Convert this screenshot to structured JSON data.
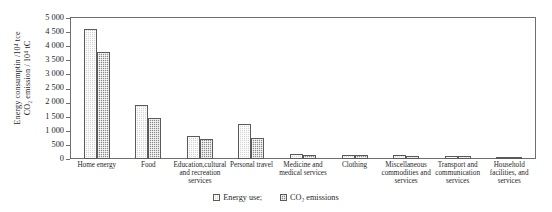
{
  "chart_data": {
    "type": "bar",
    "title": "",
    "xlabel": "",
    "ylabel_line1": "Energy consumptin /10⁴ tce",
    "ylabel_line2": "CO₂ emission / 10⁴ tC",
    "ylim": [
      0,
      5000
    ],
    "ytick_labels": [
      "5 000",
      "4 500",
      "4 000",
      "3 500",
      "3 000",
      "2 500",
      "2 000",
      "1 500",
      "1 000",
      "500",
      "0"
    ],
    "ytick_values": [
      5000,
      4500,
      4000,
      3500,
      3000,
      2500,
      2000,
      1500,
      1000,
      500,
      0
    ],
    "grid": false,
    "legend_position": "bottom-center",
    "categories": [
      "Home energy",
      "Food",
      "Education,cultural and recreation services",
      "Personal travel",
      "Medicine and medical services",
      "Clothing",
      "Miscellaneous commodities and services",
      "Transport and communication services",
      "Household facilities, and services"
    ],
    "series": [
      {
        "name": "Energy use;",
        "color": "#d4d4d4",
        "values": [
          4600,
          1900,
          800,
          1250,
          180,
          150,
          130,
          110,
          80
        ]
      },
      {
        "name": "CO₂ emissions",
        "color": "#8a8a8a",
        "values": [
          3800,
          1450,
          700,
          750,
          150,
          130,
          120,
          90,
          60
        ]
      }
    ]
  },
  "axis": {
    "category_labels": [
      [
        "Home energy"
      ],
      [
        "Food"
      ],
      [
        "Education,cultural",
        "and recreation",
        "services"
      ],
      [
        "Personal travel"
      ],
      [
        "Medicine and",
        "medical services"
      ],
      [
        "Clothing"
      ],
      [
        "Miscellaneous",
        "commodities and",
        "services"
      ],
      [
        "Transport and",
        "communication",
        "services"
      ],
      [
        "Household",
        "facilities, and",
        "services"
      ]
    ]
  },
  "legend": {
    "items": [
      {
        "label": "Energy use;"
      },
      {
        "label": "CO₂ emissions"
      }
    ]
  }
}
